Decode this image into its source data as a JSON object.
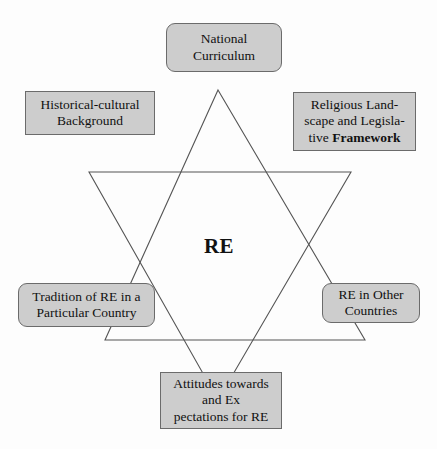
{
  "diagram": {
    "title_center": "RE",
    "star": {
      "stroke_color": "#555555",
      "fill": "none",
      "up_triangle": "218,90 365,340 105,340",
      "down_triangle": "89,172 351,172 218,400"
    },
    "box_style": {
      "fill": "#cdcdcd",
      "border": "#6b6b6b"
    },
    "nodes": [
      {
        "id": "national-curriculum",
        "label": "National\nCurriculum",
        "shape": "rounded-rectangle"
      },
      {
        "id": "historical-cultural-background",
        "label": "Historical-cultural\nBackground",
        "shape": "rectangle"
      },
      {
        "id": "religious-landscape-legislative-framework",
        "label_line1": "Religious Land-",
        "label_line2": "scape and Legisla-",
        "label_line3_normal": "tive ",
        "label_line3_bold": "Framework",
        "shape": "rectangle"
      },
      {
        "id": "tradition-of-re-in-a-particular-country",
        "label": "Tradition of RE in a\nParticular Country",
        "shape": "rounded-rectangle"
      },
      {
        "id": "re-in-other-countries",
        "label": "RE in Other\nCountries",
        "shape": "rounded-rectangle"
      },
      {
        "id": "attitudes-expectations-for-re",
        "label": "Attitudes towards\nand Ex\npectations for RE",
        "shape": "rectangle"
      }
    ]
  }
}
